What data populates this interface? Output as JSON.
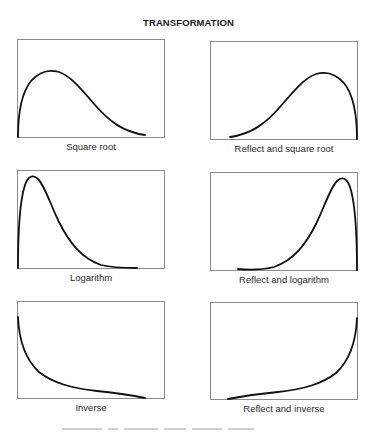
{
  "figure": {
    "title": "TRANSFORMATION",
    "panels": [
      {
        "label": "Square root",
        "shape": "moderate-positive-skew"
      },
      {
        "label": "Reflect and square root",
        "shape": "moderate-negative-skew"
      },
      {
        "label": "Logarithm",
        "shape": "substantial-positive-skew"
      },
      {
        "label": "Reflect and logarithm",
        "shape": "substantial-negative-skew"
      },
      {
        "label": "Inverse",
        "shape": "severe-positive-skew-j-shape"
      },
      {
        "label": "Reflect and inverse",
        "shape": "severe-negative-skew-j-shape"
      }
    ]
  },
  "colors": {
    "frame": "#8a8a8a",
    "curve": "#111111",
    "text": "#2a2a2a",
    "background": "#ffffff"
  }
}
